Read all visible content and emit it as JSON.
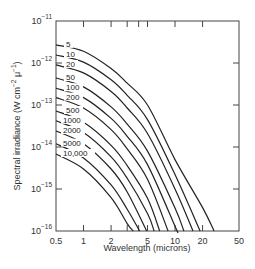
{
  "chart_data": {
    "type": "line",
    "title": "",
    "xlabel": "Wavelength (microns)",
    "ylabel": "Spectral irradiance (W cm^-2 μ^-1)",
    "xscale": "log",
    "yscale": "log",
    "xlim": [
      0.5,
      50
    ],
    "ylim": [
      1e-16,
      1e-11
    ],
    "grid": false,
    "legend_position": "inline labels at left of curves",
    "x_ticks": [
      {
        "value": 0.5,
        "label": "0.5"
      },
      {
        "value": 1,
        "label": "1"
      },
      {
        "value": 2,
        "label": "2"
      },
      {
        "value": 5,
        "label": "5"
      },
      {
        "value": 10,
        "label": "10"
      },
      {
        "value": 20,
        "label": "20"
      },
      {
        "value": 50,
        "label": "50"
      }
    ],
    "x_minor_ticks": [
      3,
      4
    ],
    "y_ticks": [
      {
        "value": 1e-11,
        "base": "10",
        "exp": "−11"
      },
      {
        "value": 1e-12,
        "base": "10",
        "exp": "−12"
      },
      {
        "value": 1e-13,
        "base": "10",
        "exp": "−13"
      },
      {
        "value": 1e-14,
        "base": "10",
        "exp": "−14"
      },
      {
        "value": 1e-15,
        "base": "10",
        "exp": "−15"
      },
      {
        "value": 1e-16,
        "base": "10",
        "exp": "−16"
      }
    ],
    "series": [
      {
        "name": "5",
        "points": [
          [
            0.5,
            2.7e-12
          ],
          [
            1,
            1.9e-12
          ],
          [
            2,
            7.4e-13
          ],
          [
            3,
            3.3e-13
          ],
          [
            5,
            1e-13
          ],
          [
            10,
            5e-15
          ],
          [
            20,
            3.6e-16
          ],
          [
            26.7,
            1e-16
          ]
        ]
      },
      {
        "name": "10",
        "points": [
          [
            0.5,
            1.55e-12
          ],
          [
            1,
            1.05e-12
          ],
          [
            2,
            4e-13
          ],
          [
            3,
            1.7e-13
          ],
          [
            5,
            4.5e-14
          ],
          [
            10,
            2.2e-15
          ],
          [
            18.8,
            1e-16
          ]
        ]
      },
      {
        "name": "20",
        "points": [
          [
            0.5,
            9e-13
          ],
          [
            1,
            5.8e-13
          ],
          [
            2,
            2.1e-13
          ],
          [
            3,
            8.5e-14
          ],
          [
            5,
            2.1e-14
          ],
          [
            10,
            1e-15
          ],
          [
            15.7,
            1e-16
          ]
        ]
      },
      {
        "name": "50",
        "points": [
          [
            0.5,
            4.4e-13
          ],
          [
            1,
            2.7e-13
          ],
          [
            2,
            9e-14
          ],
          [
            3,
            3.5e-14
          ],
          [
            5,
            8e-15
          ],
          [
            10,
            3.5e-16
          ],
          [
            12.5,
            1e-16
          ]
        ]
      },
      {
        "name": "100",
        "points": [
          [
            0.5,
            2.5e-13
          ],
          [
            1,
            1.5e-13
          ],
          [
            2,
            4.8e-14
          ],
          [
            3,
            1.8e-14
          ],
          [
            5,
            3.8e-15
          ],
          [
            10,
            1.3e-16
          ],
          [
            10.5,
            1e-16
          ]
        ]
      },
      {
        "name": "200",
        "points": [
          [
            0.5,
            1.5e-13
          ],
          [
            1,
            8.5e-14
          ],
          [
            2,
            2.6e-14
          ],
          [
            3,
            9e-15
          ],
          [
            5,
            1.7e-15
          ],
          [
            8.4,
            1e-16
          ]
        ]
      },
      {
        "name": "500",
        "points": [
          [
            0.5,
            7.2e-14
          ],
          [
            1,
            3.9e-14
          ],
          [
            2,
            1.1e-14
          ],
          [
            3,
            3.6e-15
          ],
          [
            5,
            6e-16
          ],
          [
            6.8,
            1e-16
          ]
        ]
      },
      {
        "name": "1000",
        "points": [
          [
            0.5,
            4.2e-14
          ],
          [
            1,
            2.2e-14
          ],
          [
            2,
            5.8e-15
          ],
          [
            3,
            1.8e-15
          ],
          [
            5,
            2.6e-16
          ],
          [
            5.9,
            1e-16
          ]
        ]
      },
      {
        "name": "2000",
        "points": [
          [
            0.5,
            2.4e-14
          ],
          [
            1,
            1.2e-14
          ],
          [
            2,
            3e-15
          ],
          [
            3,
            8.5e-16
          ],
          [
            4.9,
            1e-16
          ]
        ]
      },
      {
        "name": "5000",
        "points": [
          [
            0.5,
            1.2e-14
          ],
          [
            1,
            5.5e-15
          ],
          [
            2,
            1.25e-15
          ],
          [
            3,
            3.3e-16
          ],
          [
            4.1,
            1e-16
          ]
        ]
      },
      {
        "name": "10,000",
        "points": [
          [
            0.5,
            6.8e-15
          ],
          [
            1,
            3e-15
          ],
          [
            2,
            6.2e-16
          ],
          [
            3,
            1.5e-16
          ],
          [
            3.5,
            1e-16
          ]
        ]
      }
    ]
  }
}
